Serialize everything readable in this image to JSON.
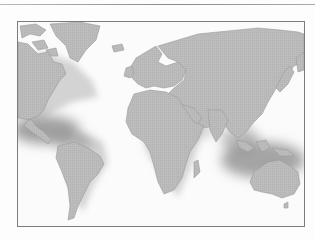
{
  "figure": {
    "type": "world-map",
    "projection": "mercator-like",
    "style": "grayscale",
    "colors": {
      "land": "#b9b9b9",
      "land_outline": "#9a9a9a",
      "ocean": "#fbfbfb",
      "highlight": "#8f8f8f",
      "frame": "#7c7c7c"
    },
    "highlighted_regions": [
      {
        "name": "caribbean-central-america"
      },
      {
        "name": "southeast-asia-indonesia"
      },
      {
        "name": "west-africa-coast"
      }
    ],
    "continents": [
      "north-america",
      "south-america",
      "greenland",
      "europe",
      "africa",
      "asia",
      "australia",
      "madagascar"
    ]
  }
}
